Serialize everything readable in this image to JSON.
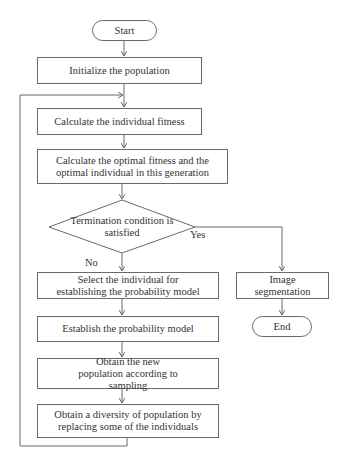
{
  "diagram": {
    "type": "flowchart",
    "nodes": {
      "start": "Start",
      "init": "Initialize the population",
      "fitness": "Calculate the individual fitness",
      "optimal": "Calculate the optimal fitness and the optimal individual in this generation",
      "decision": "Termination condition is satisfied",
      "select": "Select the individual for establishing the probability model",
      "establish": "Establish the probability model",
      "sample": "Obtain the new population according to sampling",
      "diversity": "Obtain a diversity of population by replacing some of the individuals",
      "segment": "Image segmentation",
      "end": "End"
    },
    "edge_labels": {
      "yes": "Yes",
      "no": "No"
    },
    "colors": {
      "line": "#6a6a6a",
      "text": "#333333",
      "background": "#ffffff"
    }
  }
}
